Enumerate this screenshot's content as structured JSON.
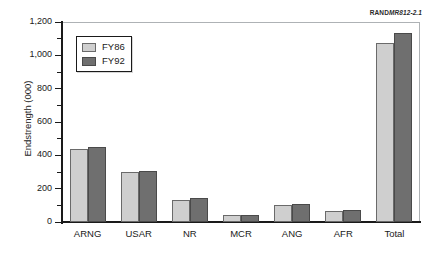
{
  "credit": {
    "mark": "RAND",
    "number": "MR812-2.1"
  },
  "chart_data": {
    "type": "bar",
    "title": "",
    "subtitle": "",
    "xlabel": "",
    "ylabel": "Endstrength (000)",
    "ylim": [
      0,
      1200
    ],
    "ytick_labels": [
      "0",
      "200",
      "400",
      "600",
      "800",
      "1,000",
      "1,200"
    ],
    "ytick_values": [
      0,
      200,
      400,
      600,
      800,
      1000,
      1200
    ],
    "minor_ticks": true,
    "grid": false,
    "legend_position": "upper-left",
    "categories": [
      "ARNG",
      "USAR",
      "NR",
      "MCR",
      "ANG",
      "AFR",
      "Total"
    ],
    "series": [
      {
        "name": "FY86",
        "color": "#cfcfcf",
        "values": [
          440,
          300,
          130,
          40,
          100,
          65,
          1075
        ]
      },
      {
        "name": "FY92",
        "color": "#6f6f6f",
        "values": [
          450,
          307,
          145,
          45,
          108,
          73,
          1135
        ]
      }
    ]
  }
}
